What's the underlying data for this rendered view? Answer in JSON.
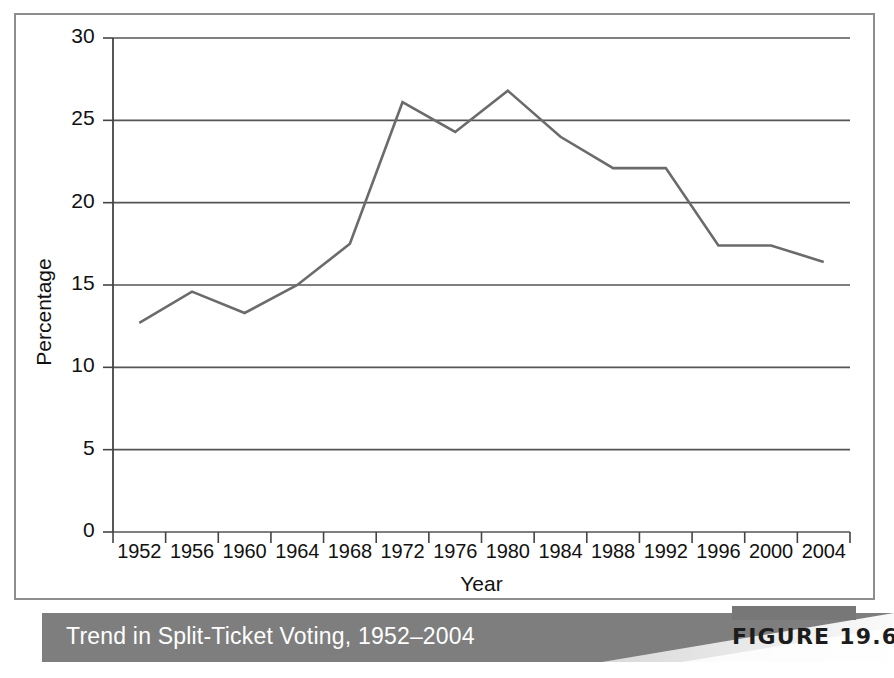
{
  "figure": {
    "caption": "Trend in Split-Ticket Voting, 1952–2004",
    "tag": "FIGURE 19.6",
    "caption_band_color": "#7e7e7e",
    "tag_bar_color": "#777777",
    "caption_text_color": "#ffffff"
  },
  "chart_data": {
    "type": "line",
    "title": "Trend in Split-Ticket Voting, 1952–2004",
    "xlabel": "Year",
    "ylabel": "Percentage",
    "categories": [
      "1952",
      "1956",
      "1960",
      "1964",
      "1968",
      "1972",
      "1976",
      "1980",
      "1984",
      "1988",
      "1992",
      "1996",
      "2000",
      "2004"
    ],
    "values": [
      12.7,
      14.6,
      13.3,
      15.0,
      17.5,
      26.1,
      24.3,
      26.8,
      24.0,
      22.1,
      22.1,
      17.4,
      17.4,
      16.4
    ],
    "series": [
      {
        "name": "Split-ticket voting",
        "values": [
          12.7,
          14.6,
          13.3,
          15.0,
          17.5,
          26.1,
          24.3,
          26.8,
          24.0,
          22.1,
          22.1,
          17.4,
          17.4,
          16.4
        ]
      }
    ],
    "ylim": [
      0,
      30
    ],
    "ytick_labels": [
      "30",
      "25",
      "20",
      "15",
      "10",
      "5",
      "0"
    ],
    "ytick_values": [
      30,
      25,
      20,
      15,
      10,
      5,
      0
    ],
    "grid": "horizontal",
    "legend": "none",
    "line_color": "#6b6b6b",
    "grid_color": "#555555",
    "axis_color": "#444444"
  }
}
